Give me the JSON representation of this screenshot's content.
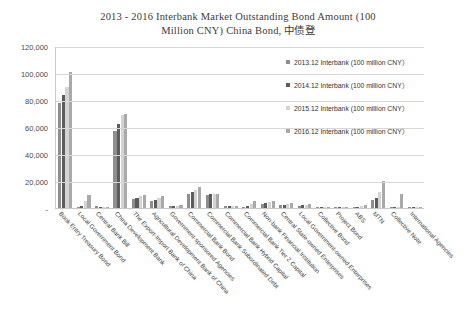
{
  "chart_data": {
    "type": "bar",
    "title": "2013 - 2016 Interbank Market Outstanding Bond Amount (100 Million CNY) China Bond, 中债登",
    "title_line1": "2013 - 2016 Interbank Market Outstanding Bond Amount (100",
    "title_line2": "Million CNY) China Bond, 中债登",
    "xlabel": "",
    "ylabel": "",
    "ylim": [
      0,
      120000
    ],
    "grid": true,
    "legend_position": "top-right",
    "ytick_labels": [
      "120,000",
      "100,000",
      "80,000",
      "60,000",
      "40,000",
      "20,000",
      "-"
    ],
    "ytick_values": [
      120000,
      100000,
      80000,
      60000,
      40000,
      20000,
      0
    ],
    "categories": [
      "Book Entry Treasury Bond",
      "Local Government Bond",
      "Central Bank Bill",
      "China Development Bank",
      "The Export-Import Bank of China",
      "Agricultural Development Bank of China",
      "Government-sponsored Agencies",
      "Commercial Bank Bond",
      "Commercial Bank Subordinated Debt",
      "Commercial Bank Hybrid Capital",
      "Commercial Bank Tier 2 Capital",
      "Non-bank Financial Institution",
      "Central State-owned Enterprises",
      "Local Government-owned Enterprises",
      "Collective Bond",
      "Project Bond",
      "ABS",
      "MTN",
      "Collective Note",
      "International Agencies"
    ],
    "series": [
      {
        "name": "2013.12 Interbank (100 million CNY)",
        "color": "#8e8e8e",
        "values": [
          78000,
          1100,
          1500,
          57000,
          7000,
          5000,
          1200,
          10500,
          9600,
          1400,
          0,
          3100,
          2000,
          1500,
          250,
          400,
          900,
          5900,
          700,
          200
        ]
      },
      {
        "name": "2014.12 Interbank (100 million CNY)",
        "color": "#5c5c5c",
        "values": [
          84000,
          1200,
          600,
          62000,
          7600,
          6200,
          1400,
          11900,
          10100,
          1400,
          1200,
          3700,
          2600,
          2200,
          250,
          500,
          1100,
          7100,
          800,
          200
        ]
      },
      {
        "name": "2015.12 Interbank (100 million CNY)",
        "color": "#d4d4d4",
        "values": [
          90000,
          5000,
          400,
          69000,
          8600,
          7400,
          1600,
          13200,
          10300,
          1400,
          3300,
          4100,
          3000,
          2500,
          200,
          900,
          1500,
          11600,
          900,
          200
        ]
      },
      {
        "name": "2016.12 Interbank (100 million CNY)",
        "color": "#a9a9a9",
        "values": [
          101000,
          10000,
          400,
          70000,
          9500,
          8600,
          2000,
          15500,
          10400,
          1400,
          5400,
          5100,
          3400,
          2800,
          150,
          1100,
          2600,
          20000,
          10500,
          600
        ]
      }
    ]
  },
  "legend": {
    "items": [
      "2013.12 Interbank (100 million CNY）",
      "2014.12 Interbank (100 million CNY）",
      "2015.12 Interbank (100 million CNY）",
      "2016.12 Interbank (100 million CNY）"
    ]
  }
}
